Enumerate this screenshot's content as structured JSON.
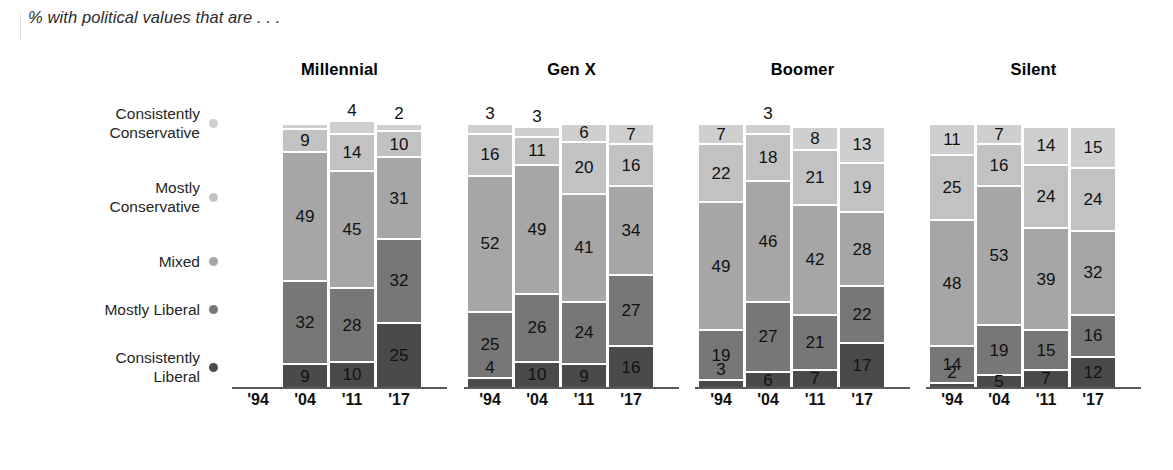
{
  "subtitle": "% with political values that are . . .",
  "legend": [
    {
      "label": "Consistently\nConservative",
      "color": "#cfcfcf",
      "key": "consistently_conservative"
    },
    {
      "label": "Mostly\nConservative",
      "color": "#c2c2c2",
      "key": "mostly_conservative"
    },
    {
      "label": "Mixed",
      "color": "#a6a6a6",
      "key": "mixed"
    },
    {
      "label": "Mostly Liberal",
      "color": "#777777",
      "key": "mostly_liberal"
    },
    {
      "label": "Consistently\nLiberal",
      "color": "#4a4a4a",
      "key": "consistently_liberal"
    }
  ],
  "chart_data": {
    "type": "bar",
    "subtype": "stacked-bar-small-multiples",
    "title": "% with political values that are . . .",
    "xlabel": "",
    "ylabel": "",
    "ylim": [
      0,
      100
    ],
    "grid": false,
    "legend_position": "left",
    "categories": [
      "'94",
      "'04",
      "'11",
      "'17"
    ],
    "series": [
      {
        "name": "Consistently Conservative",
        "color": "#cfcfcf"
      },
      {
        "name": "Mostly Conservative",
        "color": "#c2c2c2"
      },
      {
        "name": "Mixed",
        "color": "#a6a6a6"
      },
      {
        "name": "Mostly Liberal",
        "color": "#777777"
      },
      {
        "name": "Consistently Liberal",
        "color": "#4a4a4a"
      }
    ],
    "groups": [
      {
        "name": "Millennial",
        "bars": [
          {
            "x": "'94",
            "empty": true,
            "values": []
          },
          {
            "x": "'04",
            "empty": false,
            "values": [
              {
                "series": "Consistently Conservative",
                "value": 1,
                "label": ""
              },
              {
                "series": "Mostly Conservative",
                "value": 9,
                "label": "9"
              },
              {
                "series": "Mixed",
                "value": 49,
                "label": "49"
              },
              {
                "series": "Mostly Liberal",
                "value": 32,
                "label": "32"
              },
              {
                "series": "Consistently Liberal",
                "value": 9,
                "label": "9"
              }
            ]
          },
          {
            "x": "'11",
            "empty": false,
            "values": [
              {
                "series": "Consistently Conservative",
                "value": 4,
                "label": "4"
              },
              {
                "series": "Mostly Conservative",
                "value": 14,
                "label": "14"
              },
              {
                "series": "Mixed",
                "value": 45,
                "label": "45"
              },
              {
                "series": "Mostly Liberal",
                "value": 28,
                "label": "28"
              },
              {
                "series": "Consistently Liberal",
                "value": 10,
                "label": "10"
              }
            ]
          },
          {
            "x": "'17",
            "empty": false,
            "values": [
              {
                "series": "Consistently Conservative",
                "value": 2,
                "label": "2"
              },
              {
                "series": "Mostly Conservative",
                "value": 10,
                "label": "10"
              },
              {
                "series": "Mixed",
                "value": 31,
                "label": "31"
              },
              {
                "series": "Mostly Liberal",
                "value": 32,
                "label": "32"
              },
              {
                "series": "Consistently Liberal",
                "value": 25,
                "label": "25"
              }
            ]
          }
        ]
      },
      {
        "name": "Gen X",
        "bars": [
          {
            "x": "'94",
            "empty": false,
            "values": [
              {
                "series": "Consistently Conservative",
                "value": 3,
                "label": "3"
              },
              {
                "series": "Mostly Conservative",
                "value": 16,
                "label": "16"
              },
              {
                "series": "Mixed",
                "value": 52,
                "label": "52"
              },
              {
                "series": "Mostly Liberal",
                "value": 25,
                "label": "25"
              },
              {
                "series": "Consistently Liberal",
                "value": 4,
                "label": "4"
              }
            ]
          },
          {
            "x": "'04",
            "empty": false,
            "values": [
              {
                "series": "Consistently Conservative",
                "value": 3,
                "label": "3"
              },
              {
                "series": "Mostly Conservative",
                "value": 11,
                "label": "11"
              },
              {
                "series": "Mixed",
                "value": 49,
                "label": "49"
              },
              {
                "series": "Mostly Liberal",
                "value": 26,
                "label": "26"
              },
              {
                "series": "Consistently Liberal",
                "value": 10,
                "label": "10"
              }
            ]
          },
          {
            "x": "'11",
            "empty": false,
            "values": [
              {
                "series": "Consistently Conservative",
                "value": 6,
                "label": "6"
              },
              {
                "series": "Mostly Conservative",
                "value": 20,
                "label": "20"
              },
              {
                "series": "Mixed",
                "value": 41,
                "label": "41"
              },
              {
                "series": "Mostly Liberal",
                "value": 24,
                "label": "24"
              },
              {
                "series": "Consistently Liberal",
                "value": 9,
                "label": "9"
              }
            ]
          },
          {
            "x": "'17",
            "empty": false,
            "values": [
              {
                "series": "Consistently Conservative",
                "value": 7,
                "label": "7"
              },
              {
                "series": "Mostly Conservative",
                "value": 16,
                "label": "16"
              },
              {
                "series": "Mixed",
                "value": 34,
                "label": "34"
              },
              {
                "series": "Mostly Liberal",
                "value": 27,
                "label": "27"
              },
              {
                "series": "Consistently Liberal",
                "value": 16,
                "label": "16"
              }
            ]
          }
        ]
      },
      {
        "name": "Boomer",
        "bars": [
          {
            "x": "'94",
            "empty": false,
            "values": [
              {
                "series": "Consistently Conservative",
                "value": 7,
                "label": "7"
              },
              {
                "series": "Mostly Conservative",
                "value": 22,
                "label": "22"
              },
              {
                "series": "Mixed",
                "value": 49,
                "label": "49"
              },
              {
                "series": "Mostly Liberal",
                "value": 19,
                "label": "19"
              },
              {
                "series": "Consistently Liberal",
                "value": 3,
                "label": "3"
              }
            ]
          },
          {
            "x": "'04",
            "empty": false,
            "values": [
              {
                "series": "Consistently Conservative",
                "value": 3,
                "label": "3"
              },
              {
                "series": "Mostly Conservative",
                "value": 18,
                "label": "18"
              },
              {
                "series": "Mixed",
                "value": 46,
                "label": "46"
              },
              {
                "series": "Mostly Liberal",
                "value": 27,
                "label": "27"
              },
              {
                "series": "Consistently Liberal",
                "value": 6,
                "label": "6"
              }
            ]
          },
          {
            "x": "'11",
            "empty": false,
            "values": [
              {
                "series": "Consistently Conservative",
                "value": 8,
                "label": "8"
              },
              {
                "series": "Mostly Conservative",
                "value": 21,
                "label": "21"
              },
              {
                "series": "Mixed",
                "value": 42,
                "label": "42"
              },
              {
                "series": "Mostly Liberal",
                "value": 21,
                "label": "21"
              },
              {
                "series": "Consistently Liberal",
                "value": 7,
                "label": "7"
              }
            ]
          },
          {
            "x": "'17",
            "empty": false,
            "values": [
              {
                "series": "Consistently Conservative",
                "value": 13,
                "label": "13"
              },
              {
                "series": "Mostly Conservative",
                "value": 19,
                "label": "19"
              },
              {
                "series": "Mixed",
                "value": 28,
                "label": "28"
              },
              {
                "series": "Mostly Liberal",
                "value": 22,
                "label": "22"
              },
              {
                "series": "Consistently Liberal",
                "value": 17,
                "label": "17"
              }
            ]
          }
        ]
      },
      {
        "name": "Silent",
        "bars": [
          {
            "x": "'94",
            "empty": false,
            "values": [
              {
                "series": "Consistently Conservative",
                "value": 11,
                "label": "11"
              },
              {
                "series": "Mostly Conservative",
                "value": 25,
                "label": "25"
              },
              {
                "series": "Mixed",
                "value": 48,
                "label": "48"
              },
              {
                "series": "Mostly Liberal",
                "value": 14,
                "label": "14"
              },
              {
                "series": "Consistently Liberal",
                "value": 2,
                "label": "2"
              }
            ]
          },
          {
            "x": "'04",
            "empty": false,
            "values": [
              {
                "series": "Consistently Conservative",
                "value": 7,
                "label": "7"
              },
              {
                "series": "Mostly Conservative",
                "value": 16,
                "label": "16"
              },
              {
                "series": "Mixed",
                "value": 53,
                "label": "53"
              },
              {
                "series": "Mostly Liberal",
                "value": 19,
                "label": "19"
              },
              {
                "series": "Consistently Liberal",
                "value": 5,
                "label": "5"
              }
            ]
          },
          {
            "x": "'11",
            "empty": false,
            "values": [
              {
                "series": "Consistently Conservative",
                "value": 14,
                "label": "14"
              },
              {
                "series": "Mostly Conservative",
                "value": 24,
                "label": "24"
              },
              {
                "series": "Mixed",
                "value": 39,
                "label": "39"
              },
              {
                "series": "Mostly Liberal",
                "value": 15,
                "label": "15"
              },
              {
                "series": "Consistently Liberal",
                "value": 7,
                "label": "7"
              }
            ]
          },
          {
            "x": "'17",
            "empty": false,
            "values": [
              {
                "series": "Consistently Conservative",
                "value": 15,
                "label": "15"
              },
              {
                "series": "Mostly Conservative",
                "value": 24,
                "label": "24"
              },
              {
                "series": "Mixed",
                "value": 32,
                "label": "32"
              },
              {
                "series": "Mostly Liberal",
                "value": 16,
                "label": "16"
              },
              {
                "series": "Consistently Liberal",
                "value": 12,
                "label": "12"
              }
            ]
          }
        ]
      }
    ]
  }
}
